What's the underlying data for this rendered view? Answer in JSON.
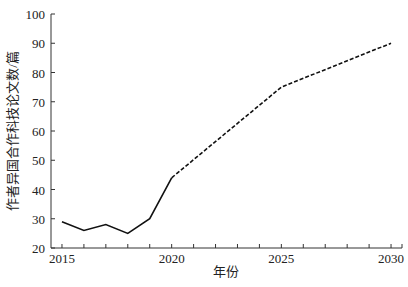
{
  "chart_data": {
    "type": "line",
    "title": "",
    "xlabel": "年份",
    "ylabel": "作者异国合作科技论文数/篇",
    "xlim": [
      2014.5,
      2030.5
    ],
    "ylim": [
      20,
      100
    ],
    "x_ticks": [
      2015,
      2020,
      2025,
      2030
    ],
    "y_ticks": [
      20,
      30,
      40,
      50,
      60,
      70,
      80,
      90,
      100
    ],
    "grid": false,
    "legend": null,
    "series": [
      {
        "name": "实际值",
        "style": "solid",
        "x": [
          2015,
          2016,
          2017,
          2018,
          2019,
          2020
        ],
        "values": [
          29,
          26,
          28,
          25,
          30,
          44
        ]
      },
      {
        "name": "预测值",
        "style": "dashed",
        "x": [
          2020,
          2025,
          2030
        ],
        "values": [
          44,
          75,
          90
        ]
      }
    ]
  }
}
